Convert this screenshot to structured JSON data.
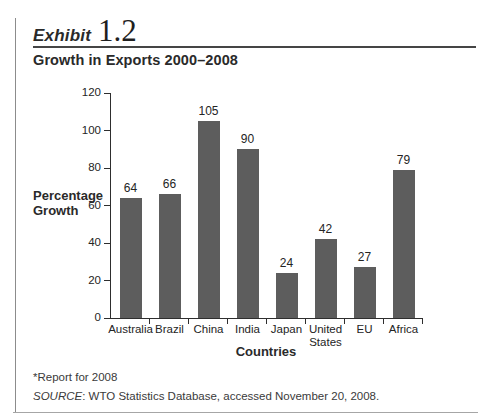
{
  "exhibit": {
    "label": "Exhibit",
    "number": "1.2"
  },
  "title": "Growth in Exports 2000–2008",
  "chart_data": {
    "type": "bar",
    "categories": [
      "Australia",
      "Brazil",
      "China",
      "India",
      "Japan",
      "United States",
      "EU",
      "Africa"
    ],
    "values": [
      64,
      66,
      105,
      90,
      24,
      42,
      27,
      79
    ],
    "title": "Growth in Exports 2000–2008",
    "xlabel": "Countries",
    "ylabel": "Percentage Growth",
    "ylim": [
      0,
      120
    ],
    "ytick_step": 20,
    "grid": false,
    "legend": false,
    "value_labels": true,
    "bar_color": "#5d5d5d",
    "axis_color": "#2e2e2e"
  },
  "footnotes": {
    "note": "*Report for 2008",
    "source_label": "SOURCE",
    "source_rest": ": WTO Statistics Database, accessed November 20, 2008."
  }
}
